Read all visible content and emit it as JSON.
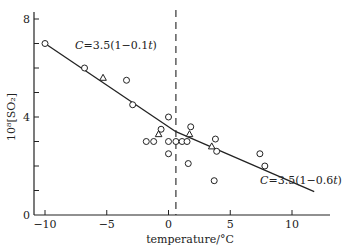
{
  "chart_data": {
    "type": "scatter",
    "title": "",
    "xlabel": "temperature/°C",
    "ylabel": "10⁸[SO₂]",
    "xlim": [
      -11,
      13
    ],
    "ylim": [
      0,
      8.3
    ],
    "xticks": [
      -10,
      -5,
      0,
      5,
      10
    ],
    "xtick_labels": [
      "−10",
      "−5",
      "0",
      "5",
      "10"
    ],
    "yticks": [
      0,
      2,
      4,
      6,
      8
    ],
    "ytick_labels": [
      "0",
      "",
      "4",
      "",
      "8"
    ],
    "grid": false,
    "legend": null,
    "reference_line": {
      "type": "vertical-dashed",
      "x": 0.6
    },
    "series": [
      {
        "name": "circles",
        "marker": "circle",
        "points": [
          [
            -10.0,
            7.0
          ],
          [
            -6.8,
            6.0
          ],
          [
            -3.4,
            5.5
          ],
          [
            -2.9,
            4.5
          ],
          [
            0.0,
            4.0
          ],
          [
            -1.8,
            3.0
          ],
          [
            -1.2,
            3.0
          ],
          [
            -0.6,
            3.5
          ],
          [
            0.0,
            3.0
          ],
          [
            0.0,
            2.5
          ],
          [
            0.6,
            3.0
          ],
          [
            1.1,
            3.0
          ],
          [
            1.5,
            3.0
          ],
          [
            1.8,
            3.6
          ],
          [
            1.6,
            2.1
          ],
          [
            3.8,
            3.1
          ],
          [
            3.9,
            2.6
          ],
          [
            3.7,
            1.4
          ],
          [
            7.4,
            2.5
          ],
          [
            7.8,
            2.0
          ]
        ]
      },
      {
        "name": "triangles",
        "marker": "triangle",
        "points": [
          [
            -5.3,
            5.6
          ],
          [
            -0.8,
            3.3
          ],
          [
            1.7,
            3.3
          ],
          [
            3.5,
            2.8
          ]
        ]
      },
      {
        "name": "fit-low-temp",
        "type": "line",
        "equation": "C=3.5(1−0.1t)",
        "points": [
          [
            -10.0,
            7.0
          ],
          [
            0.6,
            3.4
          ]
        ]
      },
      {
        "name": "fit-high-temp",
        "type": "line",
        "equation": "C=3.5(1−0.6t)",
        "points": [
          [
            0.6,
            3.4
          ],
          [
            11.8,
            0.95
          ]
        ]
      }
    ],
    "annotations": [
      {
        "text": "C=3.5(1−0.1t)",
        "x": -7.2,
        "y": 6.9
      },
      {
        "text": "C=3.5(1−0.6t)",
        "x": 7.5,
        "y": 1.4
      }
    ]
  },
  "labels": {
    "x_axis_title": "temperature/°C",
    "y_axis_title": "10⁸[SO₂]",
    "eq1_prefix": "C",
    "eq1_body": "=3.5(1−0.1",
    "eq1_var": "t",
    "eq1_suffix": ")",
    "eq2_prefix": "C",
    "eq2_body": "=3.5(1−0.6",
    "eq2_var": "t",
    "eq2_suffix": ")"
  },
  "colors": {
    "ink": "#222222",
    "background": "#ffffff"
  }
}
